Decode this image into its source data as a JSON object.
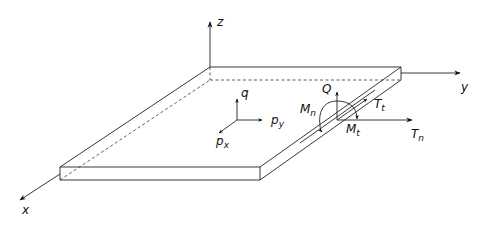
{
  "diagram": {
    "axes": {
      "x": "x",
      "y": "y",
      "z": "z"
    },
    "loads": {
      "q": {
        "main": "q",
        "sub": ""
      },
      "px": {
        "main": "p",
        "sub": "x"
      },
      "py": {
        "main": "p",
        "sub": "y"
      }
    },
    "edge_resultants": {
      "Q": {
        "main": "Q",
        "sub": ""
      },
      "Mn": {
        "main": "M",
        "sub": "n"
      },
      "Mt": {
        "main": "M",
        "sub": "t"
      },
      "Tt": {
        "main": "T",
        "sub": "t"
      },
      "Tn": {
        "main": "T",
        "sub": "n"
      }
    },
    "colors": {
      "line": "#222222",
      "background": "#ffffff"
    }
  }
}
